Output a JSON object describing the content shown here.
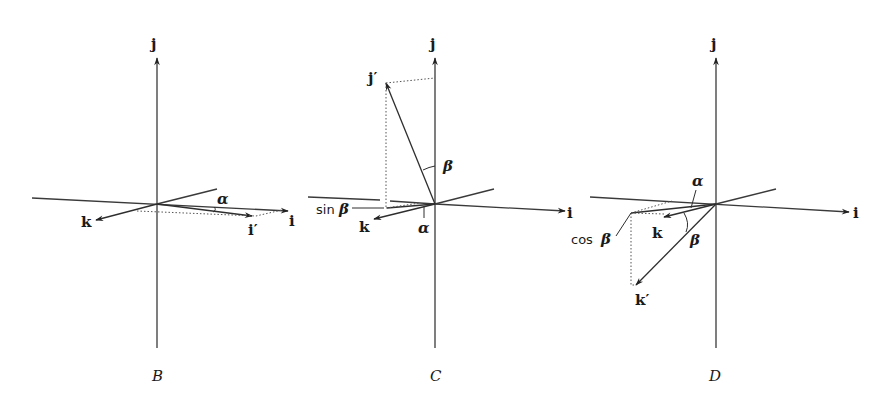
{
  "figure": {
    "panels": [
      {
        "id": "B",
        "caption": "B",
        "labels": {
          "j": "j",
          "i": "i",
          "k": "k",
          "i_prime": "i′",
          "alpha": "α"
        }
      },
      {
        "id": "C",
        "caption": "C",
        "labels": {
          "j": "j",
          "i": "i",
          "k": "k",
          "j_prime": "j′",
          "alpha": "α",
          "beta": "β",
          "sin_beta_fn": "sin",
          "sin_beta_sym": "β"
        }
      },
      {
        "id": "D",
        "caption": "D",
        "labels": {
          "j": "j",
          "i": "i",
          "k": "k",
          "k_prime": "k′",
          "alpha": "α",
          "beta": "β",
          "cos_beta_fn": "cos",
          "cos_beta_sym": "β"
        }
      }
    ]
  }
}
